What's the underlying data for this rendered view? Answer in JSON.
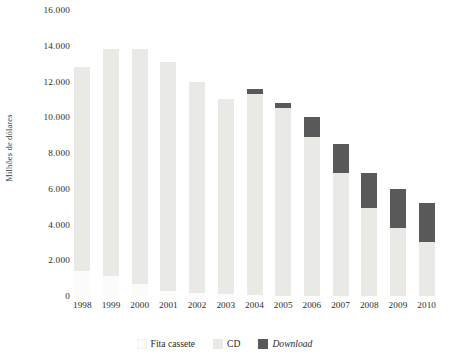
{
  "chart_data": {
    "type": "bar",
    "stacked": true,
    "title": "",
    "xlabel": "",
    "ylabel": "Milhões de dólares",
    "ylim": [
      0,
      16000
    ],
    "ytick_values": [
      16000,
      14000,
      12000,
      10000,
      8000,
      6000,
      4000,
      2000,
      0
    ],
    "ytick_labels": [
      "16.000",
      "14.000",
      "12.000",
      "10.000",
      "8.000",
      "6.000",
      "4.000",
      "2.000",
      "0"
    ],
    "grid": false,
    "legend_position": "bottom",
    "categories": [
      "1998",
      "1999",
      "2000",
      "2001",
      "2002",
      "2003",
      "2004",
      "2005",
      "2006",
      "2007",
      "2008",
      "2009",
      "2010"
    ],
    "series": [
      {
        "name": "Fita cassete",
        "color": "#fbfbfa",
        "values": [
          1400,
          1100,
          700,
          300,
          150,
          100,
          50,
          0,
          0,
          0,
          0,
          0,
          0
        ]
      },
      {
        "name": "CD",
        "color": "#e9e9e5",
        "values": [
          11400,
          12700,
          13100,
          12800,
          11850,
          10900,
          11250,
          10500,
          8900,
          6900,
          4900,
          3800,
          3000
        ]
      },
      {
        "name": "Download",
        "color": "#595959",
        "values": [
          0,
          0,
          0,
          0,
          0,
          0,
          300,
          300,
          1100,
          1600,
          2000,
          2200,
          2200
        ]
      }
    ],
    "totals": [
      12800,
      13800,
      13800,
      13100,
      12000,
      11000,
      11600,
      10800,
      10000,
      8500,
      6900,
      6000,
      5200
    ]
  },
  "legend": {
    "items": [
      {
        "label": "Fita cassete",
        "style": "normal"
      },
      {
        "label": "CD",
        "style": "normal"
      },
      {
        "label": "Download",
        "style": "italic"
      }
    ]
  }
}
